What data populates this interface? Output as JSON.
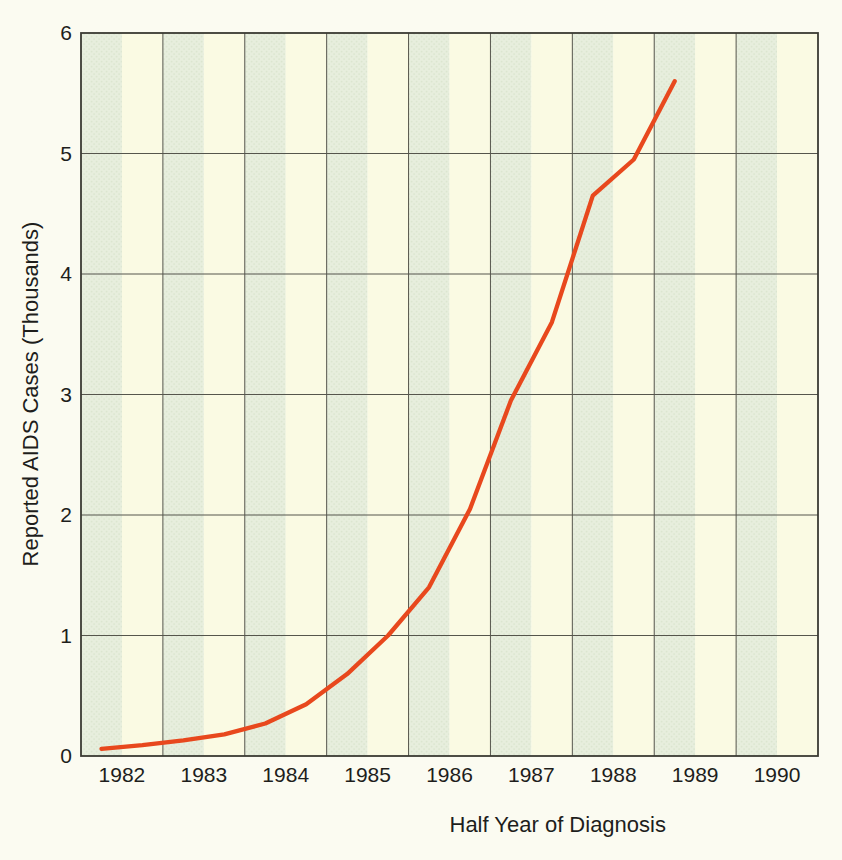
{
  "chart_data": {
    "type": "line",
    "title": "",
    "xlabel": "Half Year of Diagnosis",
    "ylabel": "Reported AIDS Cases (Thousands)",
    "x_tick_labels": [
      "1982",
      "1983",
      "1984",
      "1985",
      "1986",
      "1987",
      "1988",
      "1989",
      "1990"
    ],
    "y_ticks": [
      0,
      1,
      2,
      3,
      4,
      5,
      6
    ],
    "xlim": [
      1982,
      1991
    ],
    "ylim": [
      0,
      6
    ],
    "grid": true,
    "legend": "none",
    "stripes": "each year column split into two half-year bands: first half pale green, second half cream",
    "series": [
      {
        "x": [
          1982.25,
          1982.75,
          1983.25,
          1983.75,
          1984.25,
          1984.75,
          1985.25,
          1985.75,
          1986.25,
          1986.75,
          1987.25,
          1987.75,
          1988.25,
          1988.75,
          1989.25
        ],
        "values": [
          0.06,
          0.09,
          0.13,
          0.18,
          0.27,
          0.43,
          0.68,
          1.0,
          1.4,
          2.05,
          2.95,
          3.6,
          4.65,
          4.95,
          5.6
        ]
      }
    ],
    "colors": {
      "line": "#e8481d",
      "stripe_first_half": "#e7eedd",
      "stripe_dot": "#dbe6cf",
      "stripe_second_half": "#fafae3",
      "gridline": "#55554c",
      "border": "#3a3a32",
      "text": "#1e1e1c",
      "page_background": "#fbfbf1"
    }
  }
}
